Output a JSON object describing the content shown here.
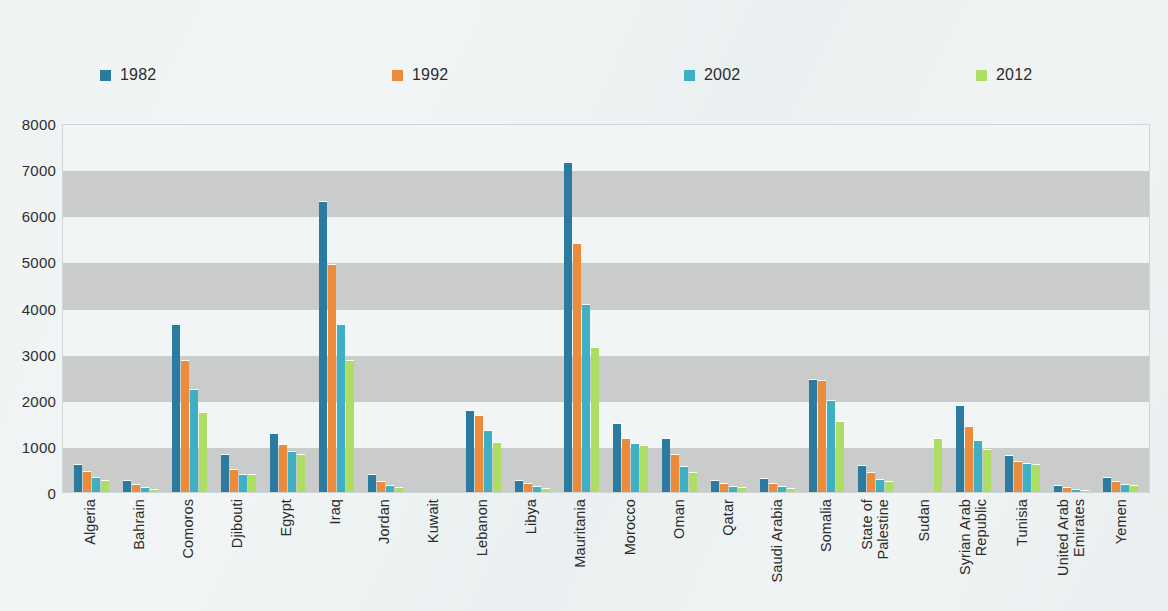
{
  "legend": {
    "items": [
      {
        "label": "1982",
        "color": "#2b7ba0"
      },
      {
        "label": "1992",
        "color": "#ed8b3c"
      },
      {
        "label": "2002",
        "color": "#3fafc4"
      },
      {
        "label": "2012",
        "color": "#aedd63"
      }
    ]
  },
  "axis": {
    "y_ticks": [
      "8000",
      "7000",
      "6000",
      "5000",
      "4000",
      "3000",
      "2000",
      "1000",
      "0"
    ]
  },
  "chart_data": {
    "type": "bar",
    "title": "",
    "subtitle": "",
    "xlabel": "",
    "ylabel": "",
    "ylim": [
      0,
      8000
    ],
    "ytick_step": 1000,
    "grid": "horizontal-alternating-bands",
    "legend_position": "top",
    "categories": [
      "Algeria",
      "Bahrain",
      "Comoros",
      "Djibouti",
      "Egypt",
      "Iraq",
      "Jordan",
      "Kuwait",
      "Lebanon",
      "Libya",
      "Mauritania",
      "Morocco",
      "Oman",
      "Qatar",
      "Saudi Arabia",
      "Somalia",
      "State of Palestine",
      "Sudan",
      "Syrian Arab Republic",
      "Tunisia",
      "United Arab Emirates",
      "Yemen"
    ],
    "series": [
      {
        "name": "1982",
        "color": "#2b7ba0",
        "values": [
          600,
          270,
          3650,
          820,
          1280,
          6320,
          390,
          0,
          1780,
          260,
          7150,
          1490,
          1180,
          270,
          300,
          2460,
          590,
          0,
          1880,
          810,
          160,
          330
        ]
      },
      {
        "name": "1992",
        "color": "#ed8b3c",
        "values": [
          450,
          180,
          2870,
          490,
          1050,
          4950,
          240,
          0,
          1680,
          190,
          5400,
          1180,
          820,
          190,
          190,
          2420,
          430,
          0,
          1430,
          680,
          110,
          240
        ]
      },
      {
        "name": "2002",
        "color": "#3fafc4",
        "values": [
          330,
          110,
          2230,
          400,
          900,
          3650,
          150,
          0,
          1350,
          130,
          4080,
          1060,
          560,
          140,
          120,
          1990,
          280,
          0,
          1130,
          630,
          70,
          180
        ]
      },
      {
        "name": "2012",
        "color": "#aedd63",
        "values": [
          250,
          70,
          1740,
          380,
          830,
          2870,
          110,
          0,
          1090,
          90,
          3150,
          1030,
          430,
          110,
          80,
          1550,
          240,
          1180,
          940,
          600,
          50,
          150
        ]
      }
    ]
  }
}
